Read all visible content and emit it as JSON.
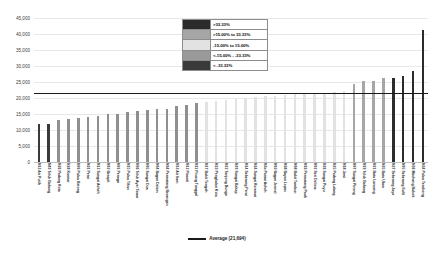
{
  "chart_data": {
    "type": "bar",
    "title": "",
    "xlabel": "",
    "ylabel": "",
    "ylim": [
      0,
      45000
    ],
    "ytick_step": 5000,
    "yticks": [
      "0",
      "5,000",
      "10,000",
      "15,000",
      "20,000",
      "25,000",
      "30,000",
      "35,000",
      "40,000",
      "45,000"
    ],
    "grid": true,
    "average_line": {
      "value": 21694,
      "label": "Average (21,694)",
      "color": "#1a1a1a"
    },
    "legend": {
      "position": "top-center",
      "entries": [
        {
          "label": ">33.33%",
          "color": "#2b2b2b"
        },
        {
          "label": ">15.00% to 33.33%",
          "color": "#a6a6a6"
        },
        {
          "label": "-15.00% to 15.00%",
          "color": "#e2e2e2"
        },
        {
          "label": "<-15.00% - -33.33%",
          "color": "#9a9a9a"
        },
        {
          "label": "< -33.33%",
          "color": "#3a3a3a"
        }
      ]
    },
    "categories": [
      "N13 Air Putih",
      "N40 Teluk Bahang",
      "N26 Padang Kota",
      "N28 Komtar",
      "N09 Pulau Betong",
      "N31 Perai",
      "N12 Sungai Acheh",
      "N02 Berapit",
      "N01 Penaga",
      "N15 Pulau Tikus",
      "N06 Teluk Ayer Tawar",
      "N05 Sungai Dua",
      "N04 Bagan Dalam",
      "N04 Permatang Berangan",
      "N13 Air Itam",
      "N12 Pinanti",
      "N11 Pinang Tunggal",
      "N17 Bukit Tengah",
      "N23 Pengkalan Kota",
      "N22 Tanjong Bunga",
      "N20 Sungai Bakap",
      "N14 Seberang Perai",
      "N24 Sungai Keramat",
      "N3a Pantai Acheh",
      "N03 Bagan Jermal",
      "N38 Bayan Lepas",
      "N08 Bukit Tambun",
      "N16 Permatang Pauh",
      "N02 Seri Delima",
      "N26 Sungai Puyu",
      "N25 Padang Lalang",
      "N18 Jawi",
      "N07 Sungai Pinang",
      "N19 Telok Bahang",
      "N21 Batu Lancang",
      "N35 Batu Uban",
      "N37 Seberang Jaya",
      "N05 Seberang Sulit",
      "N36 Machang Bubok",
      "N34 Pulau Terubong"
    ],
    "values": [
      11800,
      11900,
      13000,
      13500,
      13600,
      14100,
      14300,
      14900,
      15100,
      15700,
      16000,
      16400,
      16600,
      16700,
      17600,
      17900,
      18500,
      18700,
      19100,
      19400,
      19800,
      20000,
      20300,
      20500,
      20700,
      20900,
      21100,
      21300,
      21500,
      21700,
      21900,
      22200,
      24300,
      25200,
      25400,
      26100,
      26300,
      27000,
      28400,
      41200
    ],
    "bar_colors": [
      "#3a3a3a",
      "#3a3a3a",
      "#8f8f8f",
      "#8f8f8f",
      "#8f8f8f",
      "#8f8f8f",
      "#8f8f8f",
      "#8f8f8f",
      "#8f8f8f",
      "#8f8f8f",
      "#8f8f8f",
      "#8f8f8f",
      "#8f8f8f",
      "#8f8f8f",
      "#8f8f8f",
      "#8f8f8f",
      "#8f8f8f",
      "#e2e2e2",
      "#e2e2e2",
      "#e2e2e2",
      "#e2e2e2",
      "#e2e2e2",
      "#e2e2e2",
      "#e2e2e2",
      "#e2e2e2",
      "#e2e2e2",
      "#e2e2e2",
      "#e2e2e2",
      "#e2e2e2",
      "#e2e2e2",
      "#e2e2e2",
      "#e2e2e2",
      "#a6a6a6",
      "#a6a6a6",
      "#a6a6a6",
      "#a6a6a6",
      "#2b2b2b",
      "#2b2b2b",
      "#2b2b2b",
      "#2b2b2b"
    ]
  }
}
